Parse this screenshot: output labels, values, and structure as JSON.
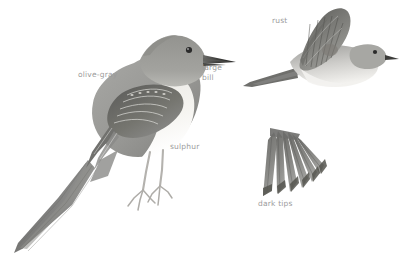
{
  "plate": {
    "subject": "flycatcher-field-guide-plate",
    "background_color": "#ffffff",
    "label_color": "#9b9b9b",
    "plumage_colors": {
      "upperparts_gray": "#9a9a98",
      "upperparts_dark": "#6f6f6e",
      "crown_gray": "#8e8e8c",
      "underparts_pale": "#f2f1ee",
      "bill_dark": "#3a3a3a",
      "eye_dark": "#2b2b2b",
      "wing_edge_pale": "#e6e5e1",
      "tail_rust_dark": "#5f5c58",
      "leg_gray": "#bcbab6"
    },
    "figures": [
      {
        "name": "perched-bird",
        "pose": "perched, facing right, long tail angled down-left"
      },
      {
        "name": "flying-bird",
        "pose": "in flight, facing right, wing raised, tail extended left"
      },
      {
        "name": "spread-tail",
        "pose": "fanned tail feathers, specimen detail"
      }
    ],
    "labels": [
      {
        "id": "olive-gray",
        "text": "olive-gray",
        "target": "perched-bird-back"
      },
      {
        "id": "large-bill",
        "line1": "large",
        "line2": "bill",
        "target": "perched-bird-bill"
      },
      {
        "id": "sulphur",
        "text": "sulphur",
        "target": "perched-bird-belly"
      },
      {
        "id": "rust",
        "text": "rust",
        "target": "flying-bird-wing"
      },
      {
        "id": "dark-tips",
        "text": "dark tips",
        "target": "spread-tail"
      }
    ]
  }
}
